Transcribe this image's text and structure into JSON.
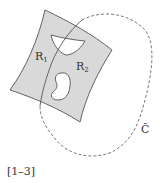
{
  "figure": {
    "labels": {
      "region1": "R",
      "region1_sub": "1",
      "region2": "R",
      "region2_sub": "2",
      "curve": "C̃",
      "caption": "[1–3]"
    },
    "colors": {
      "surface_fill": "#d9d9d9",
      "stroke": "#555555",
      "background": "#ffffff",
      "text": "#333333"
    }
  }
}
